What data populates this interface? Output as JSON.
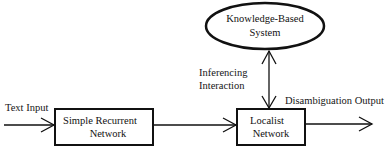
{
  "diagram": {
    "nodes": {
      "knowledge_system": {
        "line1": "Knowledge-Based",
        "line2": "System",
        "shape": "ellipse"
      },
      "srn": {
        "line1": "Simple Recurrent",
        "line2": "Network",
        "shape": "rectangle"
      },
      "localist": {
        "line1": "Localist",
        "line2": "Network",
        "shape": "rectangle"
      }
    },
    "edges": {
      "text_input": {
        "label": "Text Input",
        "from": "external",
        "to": "srn"
      },
      "srn_to_localist": {
        "label": "",
        "from": "srn",
        "to": "localist"
      },
      "inferencing": {
        "line1": "Inferencing",
        "line2": "Interaction",
        "from": "localist",
        "to": "knowledge_system",
        "bidirectional": true
      },
      "output": {
        "label": "Disambiguation Output",
        "from": "localist",
        "to": "external"
      }
    },
    "colors": {
      "stroke": "#111111",
      "background": "#ffffff"
    }
  }
}
